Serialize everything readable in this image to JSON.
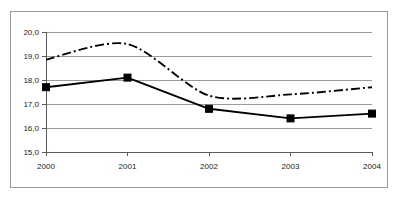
{
  "chart_data": {
    "type": "line",
    "title": "",
    "subtitle": "",
    "xlabel": "",
    "ylabel": "",
    "categories": [
      "2000",
      "2001",
      "2002",
      "2003",
      "2004"
    ],
    "series": [
      {
        "name": "series-solid-square",
        "style": "solid",
        "marker": "filled-square",
        "color": "#000000",
        "values": [
          17.7,
          18.1,
          16.8,
          16.4,
          16.6
        ]
      },
      {
        "name": "series-dash-dot",
        "style": "dash-dot",
        "marker": "none",
        "color": "#000000",
        "values": [
          18.85,
          19.5,
          17.35,
          17.4,
          17.7
        ]
      }
    ],
    "ylim": [
      15.0,
      20.0
    ],
    "ytick_values": [
      20.0,
      19.0,
      18.0,
      17.0,
      16.0,
      15.0
    ],
    "ytick_labels": [
      "20,0",
      "19,0",
      "18,0",
      "17,0",
      "16,0",
      "15,0"
    ],
    "xtick_labels": [
      "2000",
      "2001",
      "2002",
      "2003",
      "2004"
    ],
    "grid": "horizontal",
    "legend": "none",
    "decimal_separator": ","
  },
  "axes": {
    "y_labels": [
      "20,0",
      "19,0",
      "18,0",
      "17,0",
      "16,0",
      "15,0"
    ],
    "x_labels": [
      "2000",
      "2001",
      "2002",
      "2003",
      "2004"
    ]
  },
  "colors": {
    "grid": "#9a9a9a",
    "axis": "#5a5a5a",
    "frame": "#9a9a9a",
    "series": "#000000",
    "background": "#ffffff"
  }
}
